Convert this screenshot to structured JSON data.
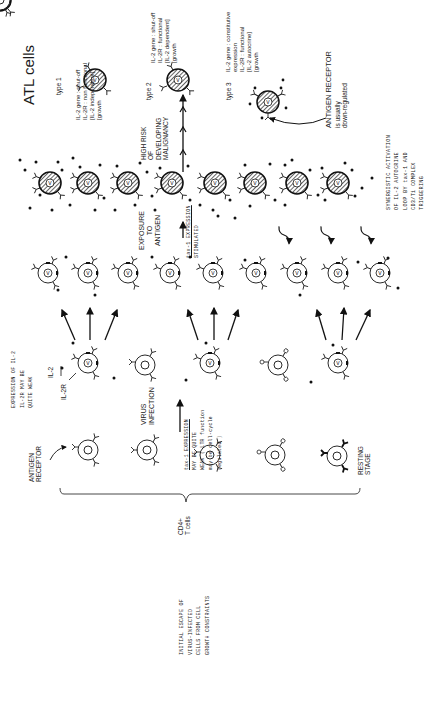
{
  "title": "ATL cells",
  "atl_types": [
    {
      "label": "type 1",
      "notes": [
        "IL-2 gene : shut-off",
        "IL-2R : non functional",
        "[IL-2 independent]",
        "[growth"
      ]
    },
    {
      "label": "type 2",
      "notes": [
        "IL-2 gene : shut-off",
        "IL-2R : functional",
        "[IL-2 dependent]",
        "[growth"
      ]
    },
    {
      "label": "type 3",
      "notes": [
        "IL-2 gene : constitutive",
        "expression",
        "IL-2R : functional",
        "[IL-2 autocrine]",
        "[growth"
      ]
    }
  ],
  "antigen_receptor_note": [
    "ANTIGEN RECEPTOR",
    "is usually",
    "down-regulated"
  ],
  "high_risk": [
    "HIGH RISK",
    "OF",
    "DEVELOPING",
    "MALIGNANCY"
  ],
  "synergistic": [
    "SYNERGISTIC ACTIVATION",
    "OF IL-2 AUTOCRINE",
    "LOOP BY tax-1 AND",
    "CD3/Ti COMPLEX",
    "TRIGGERING"
  ],
  "exposure": [
    "EXPOSURE",
    "TO",
    "ANTIGEN"
  ],
  "tax_stimulated": [
    "tax-1 EXPRESSION",
    "STIMULATED"
  ],
  "initial_escape": [
    "INITIAL ESCAPE OF",
    "VIRUS-INFECTED",
    "CELLS FROM CELL",
    "GROWTH CONSTRAINTS"
  ],
  "expression_il2": [
    "EXPRESSION OF IL-2",
    "IL-2R MAY BE",
    "QUITE WEAK"
  ],
  "il2_label": "IL-2",
  "il2r_label": "IL-2R",
  "virus_infection": [
    "VIRUS",
    "INFECTION"
  ],
  "tax_weak": [
    "tax-1 EXPRESSION",
    "MAY BE QUITE",
    "WEAK ( LTR function",
    "may be cell-cycle",
    "regulated )"
  ],
  "antigen_receptor_label": [
    "ANTIGEN",
    "RECEPTOR"
  ],
  "resting_stage": [
    "RESTING",
    "STAGE"
  ],
  "cd4_label": [
    "CD4+",
    "T cells"
  ],
  "virus_marker": "V"
}
